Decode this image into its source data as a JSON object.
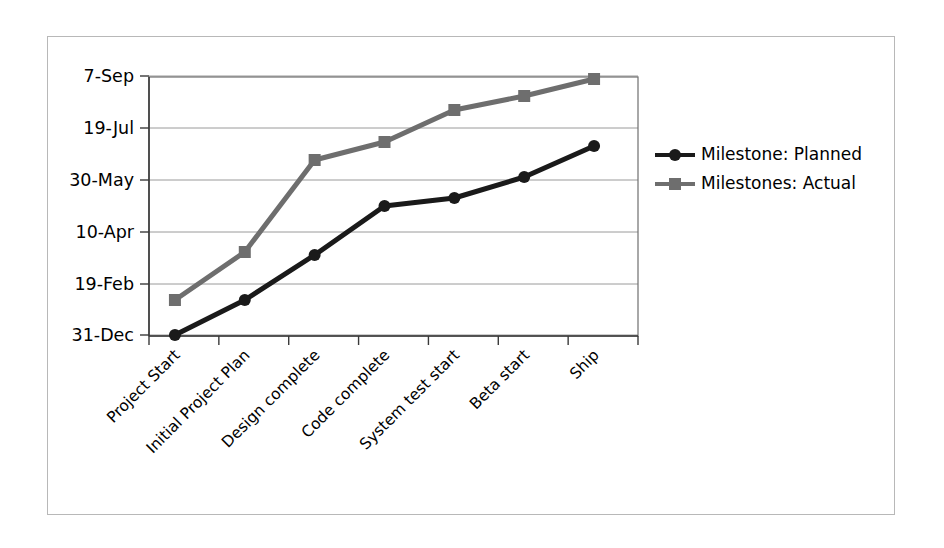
{
  "chart_data": {
    "type": "line",
    "title": "",
    "xlabel": "",
    "ylabel": "",
    "grid": true,
    "legend_position": "right",
    "categories": [
      "Project Start",
      "Initial Project Plan",
      "Design complete",
      "Code complete",
      "System test start",
      "Beta start",
      "Ship"
    ],
    "ytick_labels": [
      "31-Dec",
      "19-Feb",
      "10-Apr",
      "30-May",
      "19-Jul",
      "7-Sep"
    ],
    "ylim": [
      "31-Dec",
      "7-Sep"
    ],
    "series": [
      {
        "name": "Milestone: Planned",
        "marker": "circle",
        "color": "#1a1a1a",
        "values": [
          "31-Dec",
          "3-Feb",
          "16-Mar",
          "4-May",
          "12-May",
          "1-Jun",
          "21-Jun"
        ],
        "y_pixels": [
          335,
          300,
          255,
          206,
          198,
          177,
          146
        ]
      },
      {
        "name": "Milestones: Actual",
        "marker": "square",
        "color": "#6e6e6e",
        "values": [
          "3-Feb",
          "28-Mar",
          "6-Jun",
          "23-Jun",
          "24-Jul",
          "8-Aug",
          "24-Aug"
        ],
        "y_pixels": [
          300,
          252,
          160,
          142,
          110,
          96,
          79
        ]
      }
    ]
  },
  "legend": {
    "items": [
      {
        "label": "Milestone: Planned",
        "marker": "circle",
        "color": "#1a1a1a"
      },
      {
        "label": "Milestones: Actual",
        "marker": "square",
        "color": "#6e6e6e"
      }
    ]
  },
  "colors": {
    "planned": "#1a1a1a",
    "actual": "#6e6e6e",
    "gridline": "#9a9a9a",
    "axis": "#3a3a3a",
    "frame": "#b8b8b8",
    "background": "#ffffff"
  }
}
